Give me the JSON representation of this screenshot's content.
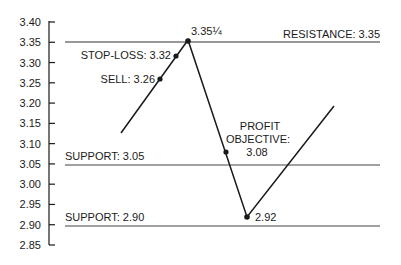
{
  "chart_data": {
    "type": "line",
    "title": "",
    "xlabel": "",
    "ylabel": "",
    "ylim": [
      2.85,
      3.4
    ],
    "grid": false,
    "legend": null,
    "y_ticks": [
      "3.40",
      "3.35",
      "3.30",
      "3.25",
      "3.20",
      "3.15",
      "3.10",
      "3.05",
      "3.00",
      "2.95",
      "2.90",
      "2.85"
    ],
    "y_tick_values": [
      3.4,
      3.35,
      3.3,
      3.25,
      3.2,
      3.15,
      3.1,
      3.05,
      3.0,
      2.95,
      2.9,
      2.85
    ],
    "horizontal_lines": [
      {
        "name": "resistance",
        "label": "RESISTANCE: 3.35",
        "value": 3.35
      },
      {
        "name": "support-upper",
        "label": "SUPPORT: 3.05",
        "value": 3.05
      },
      {
        "name": "support-lower",
        "label": "SUPPORT: 2.90",
        "value": 2.9
      }
    ],
    "price_path": [
      {
        "x": 0,
        "y": 3.12
      },
      {
        "x": 1,
        "y": 3.355
      },
      {
        "x": 2,
        "y": 2.92
      },
      {
        "x": 3,
        "y": 3.19
      }
    ],
    "points": [
      {
        "name": "sell",
        "label": "SELL: 3.26",
        "value": 3.26
      },
      {
        "name": "stop-loss",
        "label": "STOP-LOSS: 3.32",
        "value": 3.32
      },
      {
        "name": "peak",
        "label": "3.35¼",
        "value": 3.3525
      },
      {
        "name": "profit-objective",
        "label_lines": [
          "PROFIT",
          "OBJECTIVE:",
          "3.08"
        ],
        "value": 3.08
      },
      {
        "name": "trough",
        "label": "2.92",
        "value": 2.92
      }
    ]
  },
  "labels": {
    "resistance": "RESISTANCE: 3.35",
    "support_upper": "SUPPORT: 3.05",
    "support_lower": "SUPPORT: 2.90",
    "sell": "SELL: 3.26",
    "stop_loss": "STOP-LOSS: 3.32",
    "peak": "3.35¼",
    "profit_1": "PROFIT",
    "profit_2": "OBJECTIVE:",
    "profit_3": "3.08",
    "trough": "2.92"
  },
  "colors": {
    "line": "#1a1a1a",
    "ref_line": "#3a3a3a",
    "background": "#ffffff"
  }
}
